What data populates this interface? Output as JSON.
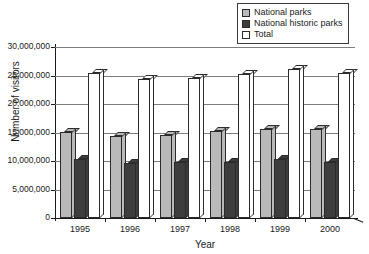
{
  "chart_data": {
    "type": "bar",
    "title": "",
    "xlabel": "Year",
    "ylabel": "Number of visitors",
    "categories": [
      "1995",
      "1996",
      "1997",
      "1998",
      "1999",
      "2000"
    ],
    "ylim": [
      0,
      30000000
    ],
    "ytick_values": [
      0,
      5000000,
      10000000,
      15000000,
      20000000,
      25000000,
      30000000
    ],
    "ytick_labels": [
      "0",
      "5,000,000",
      "10,000,000",
      "15,000,000",
      "20,000,000",
      "25,000,000",
      "30,000,000"
    ],
    "grid": true,
    "legend_position": "top-right",
    "series": [
      {
        "name": "National parks",
        "color": "#b9b9b9",
        "values": [
          15100000,
          14400000,
          14500000,
          15200000,
          15700000,
          15700000
        ]
      },
      {
        "name": "National historic parks",
        "color": "#3d3d3d",
        "values": [
          10400000,
          9700000,
          9800000,
          9900000,
          10400000,
          9800000
        ]
      },
      {
        "name": "Total",
        "color": "#ffffff",
        "values": [
          25500000,
          24300000,
          24600000,
          25200000,
          26200000,
          25500000
        ]
      }
    ]
  },
  "legend": {
    "items": [
      {
        "label": "National parks",
        "color": "#b9b9b9"
      },
      {
        "label": "National historic parks",
        "color": "#3d3d3d"
      },
      {
        "label": "Total",
        "color": "#ffffff"
      }
    ]
  },
  "colors": {
    "axis": "#1a1a1a",
    "grid": "#7d7d7d",
    "outline": "#2b2b2b",
    "background": "#ffffff"
  }
}
